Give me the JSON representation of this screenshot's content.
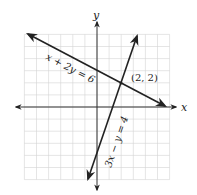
{
  "chart_data": {
    "type": "line",
    "title": "",
    "xlabel": "x",
    "ylabel": "y",
    "xlim": [
      -6,
      6
    ],
    "ylim": [
      -6,
      6
    ],
    "grid": true,
    "series": [
      {
        "name": "x + 2y = 6",
        "equation": "x + 2y = 6",
        "points": [
          [
            -6,
            6
          ],
          [
            0,
            3
          ],
          [
            2,
            2
          ],
          [
            6,
            0
          ]
        ]
      },
      {
        "name": "3x − y = 4",
        "equation": "3x − y = 4",
        "points": [
          [
            -0.7,
            -6
          ],
          [
            0,
            -4
          ],
          [
            2,
            2
          ],
          [
            3.3,
            6
          ]
        ]
      }
    ],
    "annotations": [
      {
        "text": "(2, 2)",
        "x": 2,
        "y": 2
      }
    ]
  },
  "labels": {
    "x_axis": "x",
    "y_axis": "y",
    "line1": "x + 2y = 6",
    "line2": "3x − y = 4",
    "intersection": "(2, 2)"
  },
  "colors": {
    "grid": "#d4d4d4",
    "axis": "#333333",
    "line": "#222222"
  }
}
